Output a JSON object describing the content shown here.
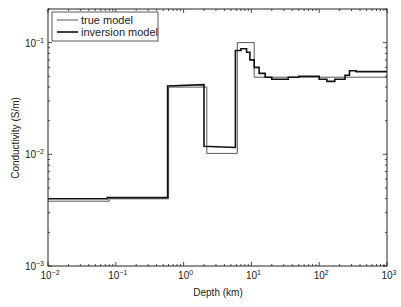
{
  "chart_data": {
    "type": "line",
    "style": "step",
    "title": "",
    "xlabel": "Depth (km)",
    "ylabel": "Conductivity (S/m)",
    "xscale": "log",
    "yscale": "log",
    "xlim": [
      0.01,
      1000
    ],
    "ylim": [
      0.001,
      0.2
    ],
    "x_ticks": [
      "10^-2",
      "10^-1",
      "10^0",
      "10^1",
      "10^2",
      "10^3"
    ],
    "y_ticks": [
      "10^-3",
      "10^-2",
      "10^-1"
    ],
    "grid": false,
    "legend": {
      "position": "upper-left",
      "entries": [
        "true model",
        "inversion model"
      ]
    },
    "series": [
      {
        "name": "true model",
        "color": "#555555",
        "width": 1,
        "x": [
          0.01,
          0.08,
          0.08,
          0.6,
          0.6,
          2.2,
          2.2,
          6.2,
          6.2,
          11,
          11,
          1000
        ],
        "y": [
          0.0038,
          0.0038,
          0.004,
          0.004,
          0.04,
          0.04,
          0.0102,
          0.0102,
          0.1,
          0.1,
          0.049,
          0.049
        ]
      },
      {
        "name": "inversion model",
        "color": "#111111",
        "width": 1.6,
        "x": [
          0.01,
          0.075,
          0.075,
          0.58,
          0.58,
          2.0,
          2.0,
          5.8,
          5.8,
          7.0,
          7.0,
          8.5,
          8.5,
          9.5,
          9.5,
          11,
          11,
          13,
          13,
          16,
          16,
          20,
          20,
          35,
          35,
          50,
          50,
          100,
          100,
          130,
          130,
          170,
          170,
          240,
          240,
          280,
          280,
          350,
          350,
          1000
        ],
        "y": [
          0.004,
          0.004,
          0.0041,
          0.0041,
          0.041,
          0.042,
          0.0118,
          0.0115,
          0.085,
          0.085,
          0.088,
          0.088,
          0.082,
          0.082,
          0.07,
          0.07,
          0.06,
          0.06,
          0.053,
          0.053,
          0.049,
          0.049,
          0.047,
          0.047,
          0.049,
          0.049,
          0.05,
          0.05,
          0.047,
          0.047,
          0.045,
          0.045,
          0.047,
          0.047,
          0.051,
          0.051,
          0.056,
          0.056,
          0.055,
          0.055
        ]
      }
    ]
  },
  "legend": {
    "true_model": "true model",
    "inversion_model": "inversion model"
  },
  "axes": {
    "xlabel": "Depth (km)",
    "ylabel": "Conductivity (S/m)",
    "x_tick_labels": [
      {
        "base": "10",
        "exp": "−2"
      },
      {
        "base": "10",
        "exp": "−1"
      },
      {
        "base": "10",
        "exp": "0"
      },
      {
        "base": "10",
        "exp": "1"
      },
      {
        "base": "10",
        "exp": "2"
      },
      {
        "base": "10",
        "exp": "3"
      }
    ],
    "y_tick_labels": [
      {
        "base": "10",
        "exp": "−3"
      },
      {
        "base": "10",
        "exp": "−2"
      },
      {
        "base": "10",
        "exp": "−1"
      }
    ]
  }
}
